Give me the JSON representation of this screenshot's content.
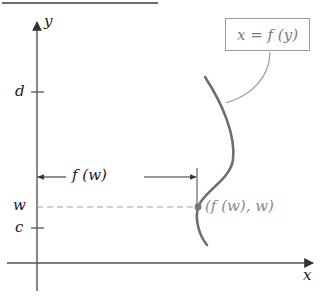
{
  "figure": {
    "title_partial": "",
    "equation_box": {
      "label": "x = f (y)"
    },
    "axes": {
      "x_label": "x",
      "y_label": "y",
      "y_ticks": [
        {
          "label": "d",
          "y_px": 92
        },
        {
          "label": "w",
          "y_px": 207
        },
        {
          "label": "c",
          "y_px": 228
        }
      ]
    },
    "width_annotation": {
      "label": "f (w)"
    },
    "point": {
      "label": "(f (w), w)"
    },
    "colors": {
      "axis": "#555555",
      "curve": "#6e6e6e",
      "connector": "#9a9a9a",
      "dashed": "#a0a0a0",
      "point": "#777777"
    }
  }
}
